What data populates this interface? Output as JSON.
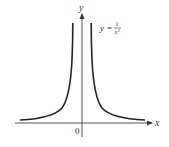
{
  "figure": {
    "type": "function-graph",
    "function": "y = 1/x^2",
    "axes": {
      "x_label": "x",
      "y_label": "y",
      "origin_label": "0"
    },
    "equation_label": {
      "lhs": "y",
      "equals": "=",
      "numerator": "1",
      "denominator_base": "x",
      "denominator_exponent": "2"
    },
    "colors": {
      "curve": "#222222",
      "axis": "#444444",
      "text": "#333333",
      "background": "#ffffff"
    }
  }
}
